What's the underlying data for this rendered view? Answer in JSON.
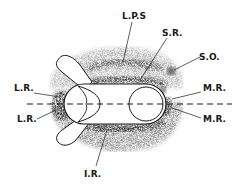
{
  "diagram": {
    "type": "anatomical-schematic",
    "colors": {
      "background": "#ffffff",
      "ink": "#1a1a1a",
      "stipple_light": "#b8b8b8",
      "stipple_mid": "#8a8a8a",
      "stipple_dark": "#3a3a3a",
      "globe_fill": "#ffffff"
    },
    "labels": [
      {
        "id": "lps",
        "text": "L.P.S",
        "x": 130,
        "y": 19
      },
      {
        "id": "sr",
        "text": "S.R.",
        "x": 167,
        "y": 36
      },
      {
        "id": "so",
        "text": "S.O.",
        "x": 202,
        "y": 60
      },
      {
        "id": "lr-upper",
        "text": "L.R.",
        "x": 14,
        "y": 91
      },
      {
        "id": "lr-lower",
        "text": "L.R.",
        "x": 17,
        "y": 119
      },
      {
        "id": "mr-upper",
        "text": "M.R.",
        "x": 203,
        "y": 91
      },
      {
        "id": "mr-lower",
        "text": "M.R.",
        "x": 203,
        "y": 121
      },
      {
        "id": "ir",
        "text": "I.R.",
        "x": 85,
        "y": 180
      }
    ]
  }
}
